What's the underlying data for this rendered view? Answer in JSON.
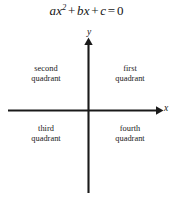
{
  "figure": {
    "width": 173,
    "height": 197,
    "background_color": "#ffffff",
    "line_color": "#1a1a1a"
  },
  "equation": {
    "full_text": "ax2 + bx + c = 0",
    "term_a_coefficient": "a",
    "term_a_variable": "x",
    "term_a_exponent": "2",
    "operator_1": "+",
    "term_b_coefficient": "b",
    "term_b_variable": "x",
    "operator_2": "+",
    "term_c": "c",
    "equals": "=",
    "right_hand_side": "0"
  },
  "axes": {
    "x_axis_label": "x",
    "y_axis_label": "y",
    "origin_x": 88,
    "origin_y": 110,
    "x_axis_start": 8,
    "x_axis_end": 163,
    "y_axis_top": 38,
    "y_axis_bottom": 193,
    "x_arrow_direction": "right",
    "y_arrow_direction": "up"
  },
  "quadrants": [
    {
      "id": "first",
      "line1": "first",
      "line2": "quadrant"
    },
    {
      "id": "second",
      "line1": "second",
      "line2": "quadrant"
    },
    {
      "id": "third",
      "line1": "third",
      "line2": "quadrant"
    },
    {
      "id": "fourth",
      "line1": "fourth",
      "line2": "quadrant"
    }
  ]
}
